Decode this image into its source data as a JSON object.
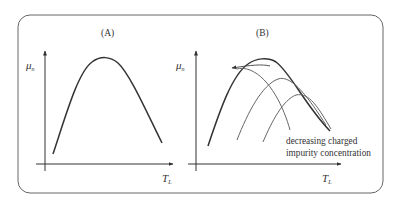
{
  "figure": {
    "panels": [
      {
        "title": "(A)",
        "ylabel": "μ",
        "ylabel_sub": "n",
        "xlabel": "T",
        "xlabel_sub": "L"
      },
      {
        "title": "(B)",
        "ylabel": "μ",
        "ylabel_sub": "n",
        "xlabel": "T",
        "xlabel_sub": "L",
        "annotation_line1": "decreasing charged",
        "annotation_line2": "impurity concentration"
      }
    ],
    "colors": {
      "frame": "#555555",
      "curve": "#333333",
      "thin_curve": "#666666"
    }
  }
}
